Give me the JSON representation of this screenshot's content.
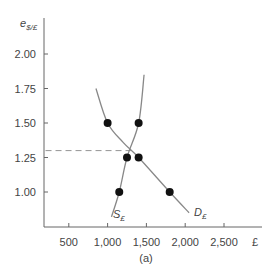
{
  "chart_data": {
    "type": "line",
    "title": "",
    "caption": "(a)",
    "xlabel": "£",
    "ylabel": "e$/£",
    "ylabel_main": "e",
    "ylabel_sub": "$/£",
    "xlim": [
      200,
      2800
    ],
    "ylim": [
      0.75,
      2.15
    ],
    "x_ticks": [
      500,
      1000,
      1500,
      2000,
      2500
    ],
    "x_tick_labels": [
      "500",
      "1,000",
      "1,500",
      "2,000",
      "2,500"
    ],
    "x_unit_label": "£",
    "y_ticks": [
      1.0,
      1.25,
      1.5,
      1.75,
      2.0
    ],
    "y_tick_labels": [
      "1.00",
      "1.25",
      "1.50",
      "1.75",
      "2.00"
    ],
    "grid": false,
    "series": [
      {
        "name": "D£",
        "label_main": "D",
        "label_sub": "£",
        "description": "Demand for pounds (downward sloping)",
        "points": [
          {
            "x": 1000,
            "y": 1.5
          },
          {
            "x": 1400,
            "y": 1.25
          },
          {
            "x": 1800,
            "y": 1.0
          }
        ],
        "curve": [
          {
            "x": 850,
            "y": 1.75
          },
          {
            "x": 1000,
            "y": 1.5
          },
          {
            "x": 1200,
            "y": 1.36
          },
          {
            "x": 1400,
            "y": 1.25
          },
          {
            "x": 1800,
            "y": 1.0
          },
          {
            "x": 2050,
            "y": 0.85
          }
        ]
      },
      {
        "name": "S£",
        "label_main": "S",
        "label_sub": "£",
        "description": "Supply of pounds (upward sloping)",
        "points": [
          {
            "x": 1150,
            "y": 1.0
          },
          {
            "x": 1250,
            "y": 1.25
          },
          {
            "x": 1400,
            "y": 1.5
          }
        ],
        "curve": [
          {
            "x": 1050,
            "y": 0.82
          },
          {
            "x": 1150,
            "y": 1.0
          },
          {
            "x": 1250,
            "y": 1.25
          },
          {
            "x": 1400,
            "y": 1.5
          },
          {
            "x": 1470,
            "y": 1.85
          }
        ]
      }
    ],
    "annotations": [
      {
        "type": "dashed-hline",
        "y": 1.3,
        "x_from": 200,
        "x_to": 1300,
        "text": "equilibrium exchange rate"
      }
    ],
    "equilibrium": {
      "x": 1300,
      "y": 1.3
    }
  }
}
